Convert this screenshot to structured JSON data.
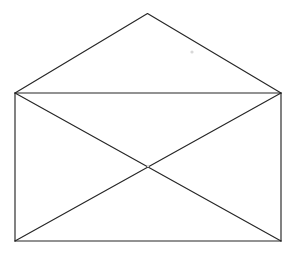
{
  "figure": {
    "kind": "line-drawing",
    "canvas": {
      "width": 294,
      "height": 254,
      "background_color": "#ffffff"
    },
    "style": {
      "stroke_color": "#262626",
      "stroke_width": 1.15,
      "fill": "none"
    },
    "points": {
      "flap_apex": {
        "x": 147.5,
        "y": 13.5
      },
      "body_top_left": {
        "x": 15,
        "y": 93
      },
      "body_top_right": {
        "x": 281,
        "y": 93
      },
      "body_bottom_left": {
        "x": 15,
        "y": 241
      },
      "body_bottom_right": {
        "x": 281,
        "y": 241
      },
      "diagonal_crossing": {
        "x": 148,
        "y": 167
      }
    },
    "segments": [
      {
        "name": "flap-left-edge",
        "from": "body_top_left",
        "to": "flap_apex"
      },
      {
        "name": "flap-right-edge",
        "from": "flap_apex",
        "to": "body_top_right"
      },
      {
        "name": "body-top-edge",
        "from": "body_top_left",
        "to": "body_top_right"
      },
      {
        "name": "body-left-edge",
        "from": "body_top_left",
        "to": "body_bottom_left"
      },
      {
        "name": "body-right-edge",
        "from": "body_top_right",
        "to": "body_bottom_right"
      },
      {
        "name": "body-bottom-edge",
        "from": "body_bottom_left",
        "to": "body_bottom_right"
      },
      {
        "name": "diagonal-tl-br",
        "from": "body_top_left",
        "to": "body_bottom_right"
      },
      {
        "name": "diagonal-tr-bl",
        "from": "body_top_right",
        "to": "body_bottom_left"
      }
    ],
    "artifact_specks": [
      {
        "x": 192,
        "y": 52,
        "r": 1.6,
        "color": "#d8d8d8"
      },
      {
        "x": 148,
        "y": 166,
        "r": 1.2,
        "color": "#d8d8d8"
      }
    ]
  }
}
